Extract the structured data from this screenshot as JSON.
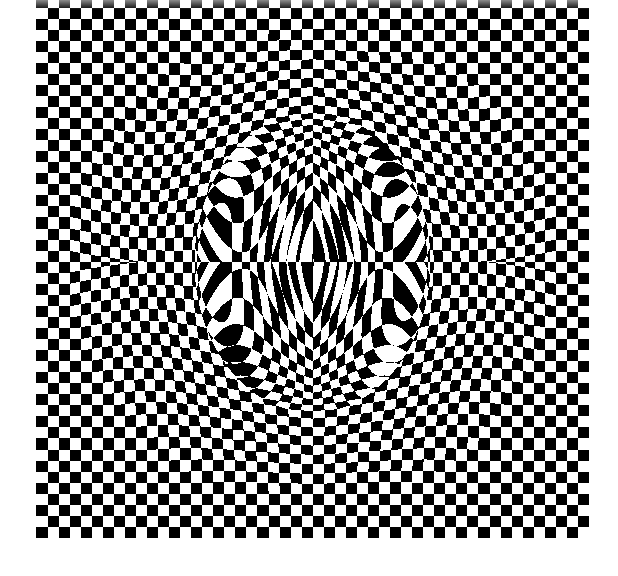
{
  "artwork": {
    "title": "Op-art checkerboard sphere illusion",
    "background": "#ffffff",
    "colors": {
      "dark": "#000000",
      "light": "#ffffff"
    },
    "board": {
      "x": 36,
      "y": -4,
      "cols": 50,
      "rows": 49,
      "cell": 11.05,
      "bottom": 538
    },
    "sphere": {
      "cx": 312,
      "cy": 262,
      "r": 244,
      "bulge": 0.55
    },
    "inner": {
      "cx": 312,
      "cy": 262,
      "rx": 118,
      "ry": 150
    }
  }
}
